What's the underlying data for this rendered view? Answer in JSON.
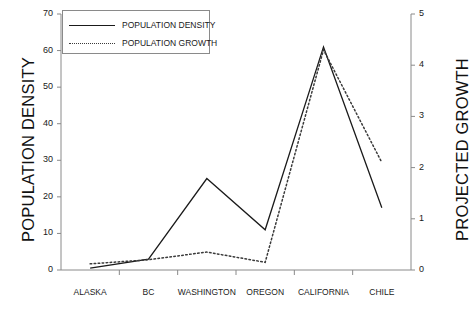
{
  "chart_data": {
    "type": "line",
    "title": "",
    "xlabel": "",
    "ylabel": "POPULATION DENSITY",
    "y2label": "PROJECTED GROWTH",
    "categories": [
      "ALASKA",
      "BC",
      "WASHINGTON",
      "OREGON",
      "CALIFORNIA",
      "CHILE"
    ],
    "ylim": [
      0,
      70
    ],
    "yticks": [
      0,
      10,
      20,
      30,
      40,
      50,
      60,
      70
    ],
    "y2lim": [
      0,
      5
    ],
    "y2ticks": [
      0,
      1,
      2,
      3,
      4,
      5
    ],
    "grid": false,
    "legend_position": "top-left",
    "series": [
      {
        "name": "POPULATION DENSITY",
        "axis": "left",
        "style": "solid",
        "color": "#1a1a1a",
        "values": [
          0.5,
          3,
          25,
          11,
          61,
          17
        ]
      },
      {
        "name": "POPULATION GROWTH",
        "axis": "right",
        "style": "dotted",
        "color": "#3a3a3a",
        "values": [
          0.12,
          0.2,
          0.35,
          0.15,
          4.3,
          2.1
        ]
      }
    ]
  },
  "legend": {
    "items": [
      {
        "label": "POPULATION DENSITY",
        "swatch": "solid-line-icon"
      },
      {
        "label": "POPULATION GROWTH",
        "swatch": "dotted-line-icon"
      }
    ]
  },
  "colors": {
    "axis": "#8a8a8a",
    "density_line": "#1a1a1a",
    "growth_line": "#3a3a3a",
    "background": "#ffffff"
  }
}
